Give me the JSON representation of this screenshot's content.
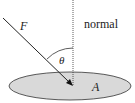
{
  "diagram": {
    "labels": {
      "force": "F",
      "normal": "normal",
      "angle": "θ",
      "area": "A"
    },
    "colors": {
      "surface_fill": "#d9d9d9",
      "stroke": "#222222",
      "background": "#ffffff"
    }
  }
}
